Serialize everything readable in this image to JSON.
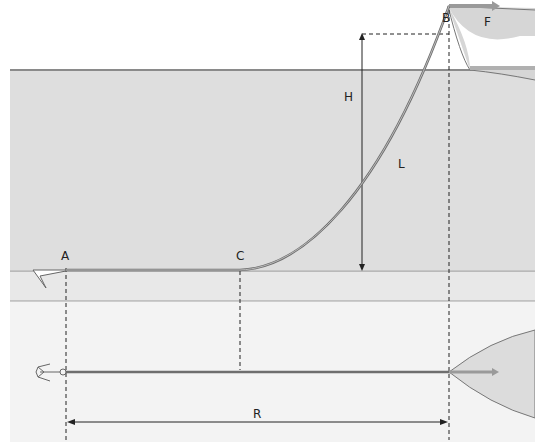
{
  "diagram": {
    "labels": {
      "A": "A",
      "B": "B",
      "C": "C",
      "F": "F",
      "H": "H",
      "L": "L",
      "R": "R"
    },
    "colors": {
      "sea": "#dedede",
      "seabed": "#e8e8e8",
      "plan_bg": "#f3f3f3",
      "surface_line": "#8a8a8a",
      "chain": "#6e6e6e",
      "force_arrow": "#9a9a9a",
      "dim_line": "#222222",
      "hull": "#d6d6d6"
    },
    "parts": {
      "side_view": "Elevation: anchor A on seabed, chain lies flat A→C, rises as catenary C→B to bow at surface",
      "top_view": "Plan: anchor, straight chain to bow, dimension R from A to B"
    }
  }
}
